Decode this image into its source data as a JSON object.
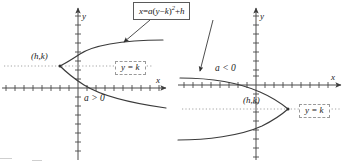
{
  "figure": {
    "equation_box": {
      "text": "x = a(y − k)² + h",
      "parts": {
        "lhs": "x",
        "equals": "=",
        "coef": "a",
        "open": "(",
        "var": "y",
        "minus": "−",
        "vertex_y": "k",
        "close": ")",
        "power": "2",
        "plus": "+",
        "vertex_x": "h"
      }
    },
    "left_graph": {
      "name": "parabola-opens-right",
      "x_axis_label": "x",
      "y_axis_label": "y",
      "vertex_label": "(h,k)",
      "axis_of_symmetry_label": "y = k",
      "condition_label": "a > 0",
      "opens": "right"
    },
    "right_graph": {
      "name": "parabola-opens-left",
      "x_axis_label": "x",
      "y_axis_label": "y",
      "vertex_label": "(h,k)",
      "axis_of_symmetry_label": "y = k",
      "condition_label": "a < 0",
      "opens": "left"
    },
    "colors": {
      "curve": "#3b3b3b",
      "axis": "#4a4a4a",
      "dotted_line": "#9a9a9a",
      "text": "#1a1a1a",
      "box_border": "#5a5a5a",
      "dashed_box_border": "#9a9a9a",
      "background": "#ffffff"
    }
  }
}
